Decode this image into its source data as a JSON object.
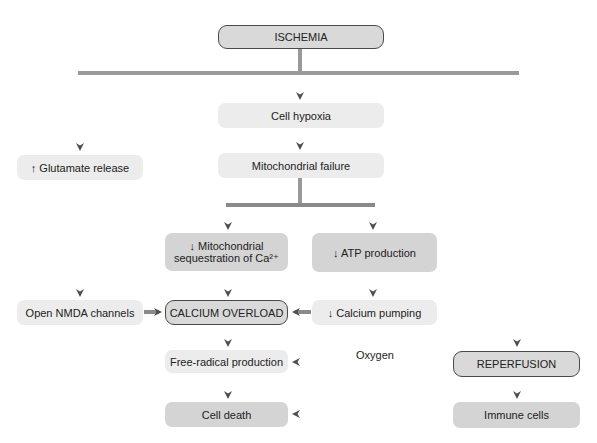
{
  "diagram": {
    "nodes": {
      "ischemia": "ISCHEMIA",
      "cell_hypoxia": "Cell hypoxia",
      "mito_failure": "Mitochondrial failure",
      "glutamate": "↑ Glutamate release",
      "mito_seq_line1": "↓ Mitochondrial",
      "mito_seq_line2": "sequestration of Ca²⁺",
      "atp": "↓ ATP production",
      "nmda": "Open NMDA channels",
      "calcium_overload": "CALCIUM OVERLOAD",
      "calcium_pumping": "↓ Calcium pumping",
      "free_radical": "Free-radical production",
      "reperfusion": "REPERFUSION",
      "cell_death": "Cell death",
      "immune": "Immune cells"
    },
    "edge_labels": {
      "oxygen": "Oxygen"
    },
    "colors": {
      "arrow": "#5a5a5a",
      "light_box": "#ececec",
      "mid_box": "#d4d4d4",
      "outline": "#4a4a4a"
    }
  }
}
